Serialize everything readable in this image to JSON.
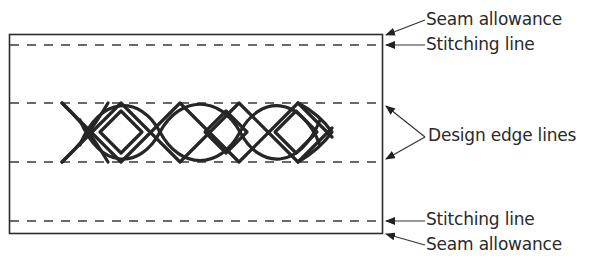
{
  "diagram": {
    "title": "",
    "colors": {
      "line": "#2b2b2b",
      "braid": "#262626",
      "arrow": "#333333",
      "text": "#2a2a2a",
      "background": "#ffffff"
    },
    "fabric_rect": {
      "x": 9,
      "y": 34,
      "width": 373,
      "height": 199
    },
    "dashed_lines": [
      {
        "name": "top-stitching-line",
        "y": 45
      },
      {
        "name": "top-design-edge-line",
        "y": 103
      },
      {
        "name": "bottom-design-edge-line",
        "y": 162
      },
      {
        "name": "bottom-stitching-line",
        "y": 221
      }
    ],
    "braid_pattern": {
      "x_start": 62,
      "x_end": 332,
      "y_top": 103,
      "y_bottom": 162
    },
    "labels": {
      "seam_allowance_top": "Seam allowance",
      "stitching_line_top": "Stitching line",
      "design_edge_lines": "Design edge lines",
      "stitching_line_bottom": "Stitching line",
      "seam_allowance_bottom": "Seam allowance"
    }
  }
}
